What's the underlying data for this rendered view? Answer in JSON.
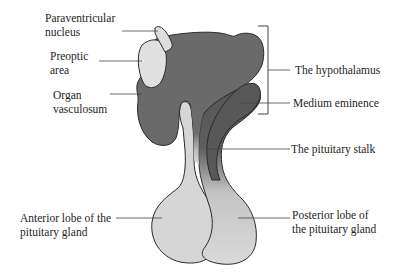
{
  "diagram": {
    "colors": {
      "hypothalamus": "#6b6b6b",
      "median_eminence": "#5a5a5a",
      "light_region": "#d9d9d9",
      "outline": "#2a2a2a",
      "leader_line": "#444444",
      "background": "#ffffff"
    },
    "labels": {
      "paraventricular_nucleus": "Paraventricular\nnucleus",
      "preoptic_area": "Preoptic\narea",
      "organ_vasculosum": "Organ\nvasculosum",
      "hypothalamus": "The hypothalamus",
      "medium_eminence": "Medium eminence",
      "pituitary_stalk": "The pituitary stalk",
      "anterior_lobe": "Anterior lobe of the\npituitary gland",
      "posterior_lobe": "Posterior lobe of\nthe pituitary gland"
    }
  }
}
